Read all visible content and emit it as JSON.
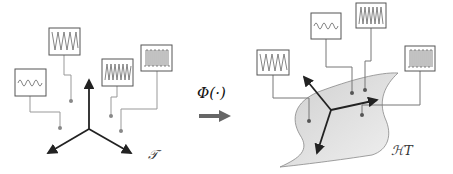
{
  "labels": {
    "mapping": "Φ(·)",
    "input_space": "𝒯",
    "feature_space": "ℋT"
  },
  "left_panel": {
    "signals": [
      "sine-wave",
      "zigzag-wave",
      "dense-zigzag-wave",
      "square-pulse-wave"
    ]
  },
  "right_panel": {
    "signals": [
      "zigzag-wave",
      "sine-wave",
      "dense-zigzag-wave",
      "square-pulse-wave"
    ]
  },
  "colors": {
    "axis": "#222222",
    "connector": "#999999",
    "box_border": "#555555",
    "manifold_fill": "#d9d9d9",
    "arrow": "#666666"
  }
}
